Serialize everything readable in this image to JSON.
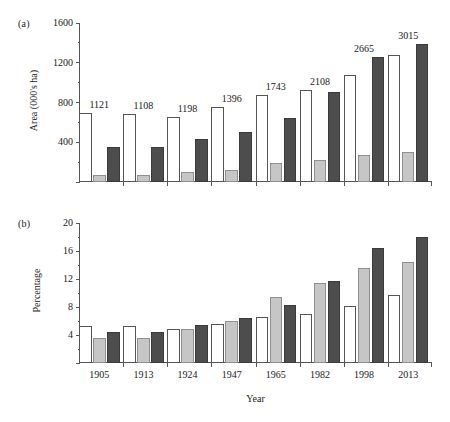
{
  "chart_data": [
    {
      "type": "bar",
      "panel": "(a)",
      "title": "",
      "xlabel": "",
      "ylabel": "Area (000's ha)",
      "categories": [
        "1905",
        "1913",
        "1924",
        "1947",
        "1965",
        "1982",
        "1998",
        "2013"
      ],
      "ylim": [
        0,
        1600
      ],
      "yticks": [
        0,
        400,
        800,
        1200,
        1600
      ],
      "ytick_labels": [
        "",
        "400",
        "800",
        "1200",
        "1600"
      ],
      "yminor_step": 200,
      "grid": false,
      "legend": "none",
      "series": [
        {
          "name": "series-1-white",
          "color": "#ffffff",
          "values": [
            690,
            680,
            650,
            750,
            880,
            930,
            1075,
            1275
          ]
        },
        {
          "name": "series-2-light-grey",
          "color": "#c6c6c6",
          "values": [
            75,
            72,
            100,
            125,
            195,
            225,
            275,
            300
          ]
        },
        {
          "name": "series-3-dark-grey",
          "color": "#4d4d4d",
          "values": [
            355,
            350,
            430,
            505,
            640,
            910,
            1255,
            1390
          ]
        }
      ],
      "annotations": {
        "label": "group-total",
        "values": [
          "1121",
          "1108",
          "1198",
          "1396",
          "1743",
          "2108",
          "2665",
          "3015"
        ]
      }
    },
    {
      "type": "bar",
      "panel": "(b)",
      "title": "",
      "xlabel": "Year",
      "ylabel": "Percentage",
      "categories": [
        "1905",
        "1913",
        "1924",
        "1947",
        "1965",
        "1982",
        "1998",
        "2013"
      ],
      "ylim": [
        0,
        20
      ],
      "yticks": [
        0,
        4,
        8,
        12,
        16,
        20
      ],
      "ytick_labels": [
        "",
        "4",
        "8",
        "12",
        "16",
        "20"
      ],
      "yminor_step": 2,
      "grid": false,
      "legend": "none",
      "series": [
        {
          "name": "series-1-white",
          "color": "#ffffff",
          "values": [
            5.3,
            5.3,
            4.9,
            5.6,
            6.6,
            7.0,
            8.1,
            9.7
          ]
        },
        {
          "name": "series-2-light-grey",
          "color": "#c6c6c6",
          "values": [
            3.6,
            3.6,
            4.9,
            6.0,
            9.5,
            11.5,
            13.6,
            14.5
          ]
        },
        {
          "name": "series-3-dark-grey",
          "color": "#4d4d4d",
          "values": [
            4.5,
            4.4,
            5.5,
            6.4,
            8.3,
            11.7,
            16.4,
            18.0
          ]
        }
      ],
      "annotations": {
        "label": "group-total",
        "values": [
          "",
          "",
          "",
          "",
          "",
          "",
          "",
          ""
        ]
      }
    }
  ]
}
